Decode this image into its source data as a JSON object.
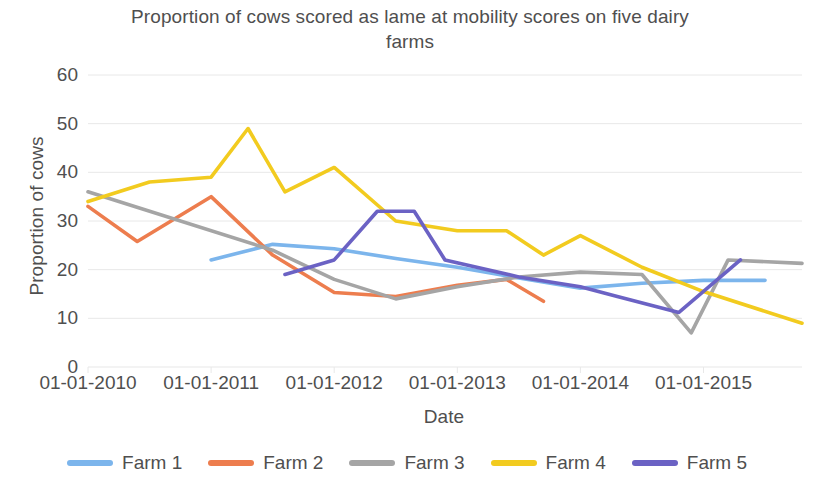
{
  "chart_data": {
    "type": "line",
    "title": "Proportion of cows scored as lame at mobility scores on five dairy farms",
    "xlabel": "Date",
    "ylabel": "Proportion of cows",
    "ylim": [
      0,
      60
    ],
    "ytick_values": [
      0,
      10,
      20,
      30,
      40,
      50,
      60
    ],
    "xtick_labels": [
      "01-01-2010",
      "01-01-2011",
      "01-01-2012",
      "01-01-2013",
      "01-01-2014",
      "01-01-2015"
    ],
    "xlim_years": [
      2010,
      2015.8
    ],
    "grid": "horizontal",
    "legend_position": "bottom",
    "colors": {
      "farm1": "#7cb5ec",
      "farm2": "#ed7d4e",
      "farm3": "#a5a5a5",
      "farm4": "#f2cb1f",
      "farm5": "#6b62c4",
      "text": "#4f4f4f",
      "gridline": "#e8e8e8"
    },
    "series": [
      {
        "name": "Farm 1",
        "color": "#7cb5ec",
        "points": [
          {
            "x": 2011.0,
            "y": 22.0
          },
          {
            "x": 2011.5,
            "y": 25.2
          },
          {
            "x": 2012.0,
            "y": 24.3
          },
          {
            "x": 2012.5,
            "y": 22.3
          },
          {
            "x": 2013.0,
            "y": 20.5
          },
          {
            "x": 2013.5,
            "y": 18.3
          },
          {
            "x": 2014.0,
            "y": 16.2
          },
          {
            "x": 2014.5,
            "y": 17.2
          },
          {
            "x": 2015.0,
            "y": 17.8
          },
          {
            "x": 2015.5,
            "y": 17.8
          }
        ]
      },
      {
        "name": "Farm 2",
        "color": "#ed7d4e",
        "points": [
          {
            "x": 2010.0,
            "y": 33.0
          },
          {
            "x": 2010.4,
            "y": 25.8
          },
          {
            "x": 2011.0,
            "y": 35.0
          },
          {
            "x": 2011.5,
            "y": 23.0
          },
          {
            "x": 2012.0,
            "y": 15.3
          },
          {
            "x": 2012.5,
            "y": 14.5
          },
          {
            "x": 2013.0,
            "y": 16.8
          },
          {
            "x": 2013.4,
            "y": 18.0
          },
          {
            "x": 2013.7,
            "y": 13.5
          }
        ]
      },
      {
        "name": "Farm 3",
        "color": "#a5a5a5",
        "points": [
          {
            "x": 2010.0,
            "y": 36.0
          },
          {
            "x": 2011.5,
            "y": 24.0
          },
          {
            "x": 2012.0,
            "y": 18.0
          },
          {
            "x": 2012.5,
            "y": 14.0
          },
          {
            "x": 2013.0,
            "y": 16.5
          },
          {
            "x": 2013.5,
            "y": 18.5
          },
          {
            "x": 2014.0,
            "y": 19.5
          },
          {
            "x": 2014.5,
            "y": 19.0
          },
          {
            "x": 2014.9,
            "y": 7.0
          },
          {
            "x": 2015.2,
            "y": 22.0
          },
          {
            "x": 2015.8,
            "y": 21.3
          }
        ]
      },
      {
        "name": "Farm 4",
        "color": "#f2cb1f",
        "points": [
          {
            "x": 2010.0,
            "y": 34.0
          },
          {
            "x": 2010.5,
            "y": 38.0
          },
          {
            "x": 2011.0,
            "y": 39.0
          },
          {
            "x": 2011.3,
            "y": 49.0
          },
          {
            "x": 2011.6,
            "y": 36.0
          },
          {
            "x": 2012.0,
            "y": 41.0
          },
          {
            "x": 2012.5,
            "y": 30.0
          },
          {
            "x": 2013.0,
            "y": 28.0
          },
          {
            "x": 2013.4,
            "y": 28.0
          },
          {
            "x": 2013.7,
            "y": 23.0
          },
          {
            "x": 2014.0,
            "y": 27.0
          },
          {
            "x": 2014.5,
            "y": 20.5
          },
          {
            "x": 2015.0,
            "y": 15.5
          },
          {
            "x": 2015.8,
            "y": 9.0
          }
        ]
      },
      {
        "name": "Farm 5",
        "color": "#6b62c4",
        "points": [
          {
            "x": 2011.6,
            "y": 19.0
          },
          {
            "x": 2012.0,
            "y": 22.0
          },
          {
            "x": 2012.35,
            "y": 32.0
          },
          {
            "x": 2012.65,
            "y": 32.0
          },
          {
            "x": 2012.9,
            "y": 22.0
          },
          {
            "x": 2013.5,
            "y": 18.5
          },
          {
            "x": 2014.0,
            "y": 16.5
          },
          {
            "x": 2014.3,
            "y": 14.5
          },
          {
            "x": 2014.8,
            "y": 11.2
          },
          {
            "x": 2015.3,
            "y": 22.0
          }
        ]
      }
    ]
  },
  "legend": {
    "items": [
      {
        "label": "Farm 1",
        "color": "#7cb5ec"
      },
      {
        "label": "Farm 2",
        "color": "#ed7d4e"
      },
      {
        "label": "Farm 3",
        "color": "#a5a5a5"
      },
      {
        "label": "Farm 4",
        "color": "#f2cb1f"
      },
      {
        "label": "Farm 5",
        "color": "#6b62c4"
      }
    ]
  }
}
